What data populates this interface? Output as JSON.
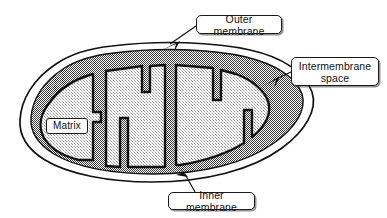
{
  "diagram": {
    "background_color": "#ffffff",
    "line_color": "#111111",
    "labels": {
      "outer_membrane": "Outer membrane",
      "intermembrane_space": "Intermembrane\nspace",
      "inner_membrane": "Inner membrane",
      "matrix": "Matrix"
    },
    "regions": {
      "outer_membrane_fill": "#ffffff",
      "intermembrane_space_fill": "#8c8c8c",
      "matrix_fill": "#8c8c8c",
      "cristae_lumen_fill": "#d9d9d9"
    },
    "leaders": {
      "outer_membrane_arrow": "arrow-down-left",
      "intermembrane_space_arrow": "arrow-down-left",
      "inner_membrane_arrow": "arrow-up-left"
    }
  }
}
